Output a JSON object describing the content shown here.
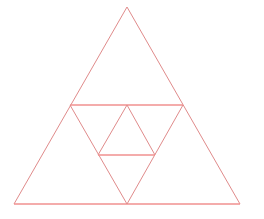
{
  "figure": {
    "background_color": "#ffffff",
    "width": 264,
    "height": 219,
    "stroke_color_diagonal": "#e08b8b",
    "stroke_color_horizontal": "#f0908f",
    "stroke_width_diagonal": 1,
    "stroke_width_horizontal": 1.6,
    "shapes": [
      {
        "name": "outer-triangle",
        "kind": "triangle-upright",
        "points": "127,7 14,204 240,204",
        "label": "Outer large triangle"
      },
      {
        "name": "inverted-triangle",
        "kind": "triangle-inverted",
        "points": "70,105 183,105 127,204",
        "label": "Central inverted triangle"
      },
      {
        "name": "inner-triangle",
        "kind": "triangle-upright",
        "points": "127,105 98,155 155,155",
        "label": "Inner small upright triangle"
      }
    ],
    "segments": [
      {
        "name": "outer-left-edge",
        "x1": 127,
        "y1": 7,
        "x2": 14,
        "y2": 204,
        "weight": "thin"
      },
      {
        "name": "outer-right-edge",
        "x1": 127,
        "y1": 7,
        "x2": 240,
        "y2": 204,
        "weight": "thin"
      },
      {
        "name": "outer-base",
        "x1": 14,
        "y1": 204,
        "x2": 240,
        "y2": 204,
        "weight": "bold"
      },
      {
        "name": "midline-horizontal",
        "x1": 70,
        "y1": 105,
        "x2": 183,
        "y2": 105,
        "weight": "bold"
      },
      {
        "name": "inverted-left-edge",
        "x1": 70,
        "y1": 105,
        "x2": 127,
        "y2": 204,
        "weight": "thin"
      },
      {
        "name": "inverted-right-edge",
        "x1": 183,
        "y1": 105,
        "x2": 127,
        "y2": 204,
        "weight": "thin"
      },
      {
        "name": "inner-left-edge",
        "x1": 127,
        "y1": 105,
        "x2": 98,
        "y2": 155,
        "weight": "thin"
      },
      {
        "name": "inner-right-edge",
        "x1": 127,
        "y1": 105,
        "x2": 155,
        "y2": 155,
        "weight": "thin"
      },
      {
        "name": "inner-base-horizontal",
        "x1": 98,
        "y1": 155,
        "x2": 155,
        "y2": 155,
        "weight": "bold"
      }
    ],
    "vertices": [
      {
        "name": "apex",
        "x": 127,
        "y": 7
      },
      {
        "name": "bottom-left",
        "x": 14,
        "y": 204
      },
      {
        "name": "bottom-right",
        "x": 240,
        "y": 204
      },
      {
        "name": "mid-left",
        "x": 70,
        "y": 105
      },
      {
        "name": "mid-right",
        "x": 183,
        "y": 105
      },
      {
        "name": "mid-bottom",
        "x": 127,
        "y": 204
      },
      {
        "name": "inner-apex",
        "x": 127,
        "y": 105
      },
      {
        "name": "inner-bottom-left",
        "x": 98,
        "y": 155
      },
      {
        "name": "inner-bottom-right",
        "x": 155,
        "y": 155
      }
    ]
  }
}
